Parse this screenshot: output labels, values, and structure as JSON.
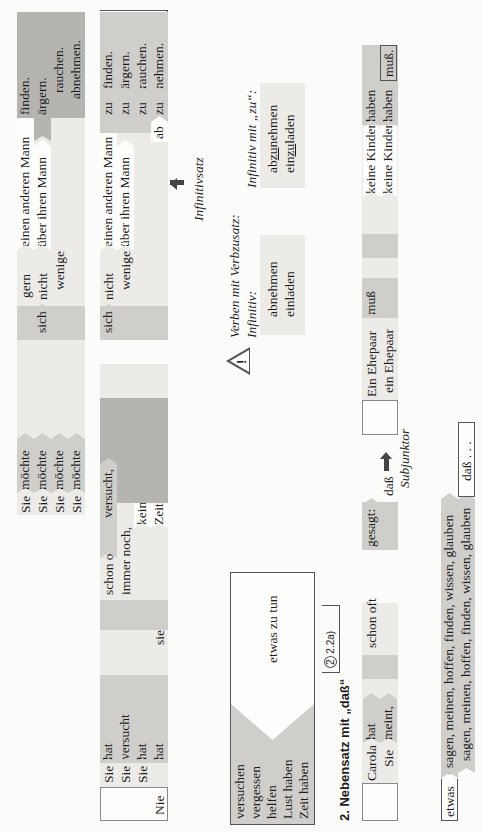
{
  "section1": {
    "rows": [
      {
        "subject": "Sie",
        "verb": "möchte",
        "middle": "gern",
        "object": "einen anderen Mann",
        "final": "finden."
      },
      {
        "subject": "Sie",
        "verb": "möchte",
        "reflexive": "sich",
        "middle": "nicht",
        "object": "über ihren Mann",
        "final": "ärgern."
      },
      {
        "subject": "Sie",
        "verb": "möchte",
        "middle": "weniger",
        "final": "rauchen."
      },
      {
        "subject": "Sie",
        "verb": "möchte",
        "final": "abnehmen."
      }
    ],
    "infinitive_rows": [
      {
        "reflexive": "",
        "middle": "",
        "object": "einen anderen Mann",
        "zu": "zu",
        "final": "finden."
      },
      {
        "reflexive": "sich",
        "middle": "nicht",
        "object": "über ihren Mann",
        "zu": "zu",
        "final": "ärgern."
      },
      {
        "middle": "weniger",
        "zu": "zu",
        "final": "rauchen."
      },
      {
        "prefix": "ab",
        "zu": "zu",
        "final": "nehmen."
      }
    ],
    "infinitivsatz_label": "Infinitivsatz"
  },
  "note": {
    "warning_icon": "warning-triangle-icon",
    "title": "Verben mit Verbzusatz:",
    "infinitiv_label": "Infinitiv:",
    "infinitiv_words": [
      "abnehmen",
      "einladen"
    ],
    "infinitiv_zu_label": "Infinitiv mit „zu“:",
    "infinitiv_zu_words": [
      {
        "pre": "ab",
        "zu": "zu",
        "post": "nehmen"
      },
      {
        "pre": "ein",
        "zu": "zu",
        "post": "laden"
      }
    ]
  },
  "section1b": {
    "rows": [
      {
        "subject": "Sie",
        "verb": "hat",
        "adverb": "schon oft",
        "final": "versucht,"
      },
      {
        "subject": "Sie",
        "verb": "versucht",
        "adverb": "immer noch,"
      },
      {
        "subject": "Sie",
        "verb": "hat",
        "object": "keine Lust,"
      },
      {
        "pre": "Nie",
        "verb": "hat",
        "subject": "sie",
        "object": "Zeit,"
      }
    ]
  },
  "verb_box": {
    "verbs": [
      "versuchen",
      "vergessen",
      "helfen",
      "Lust haben",
      "Zeit haben"
    ],
    "complement": "etwas zu tun",
    "reference": "2, 2.2a)",
    "reference_number": "2"
  },
  "section2": {
    "heading": "2. Nebensatz mit „daß“",
    "main_rows": [
      {
        "subject": "Carola",
        "verb": "hat",
        "adverb": "schon oft",
        "final": "gesagt:"
      },
      {
        "subject": "Sie",
        "verb": "meint,"
      }
    ],
    "subjunktor": "daß",
    "subjunktor_label": "Subjunktor",
    "sub_rows": [
      {
        "subject": "Ein Ehepaar",
        "verb": "muß",
        "object": "keine Kinder",
        "inf": "haben"
      },
      {
        "pre": "daß",
        "subject": "ein Ehepaar",
        "object": "keine Kinder",
        "inf": "haben",
        "verb": "muß."
      }
    ]
  },
  "bottom": {
    "etwas": "etwas",
    "verbs_line1": "sagen, meinen, hoffen, finden, wissen, glauben",
    "verbs_line2": "sagen, meinen, hoffen, finden, wissen, glauben",
    "dass_ellipsis": "daß . . ."
  }
}
